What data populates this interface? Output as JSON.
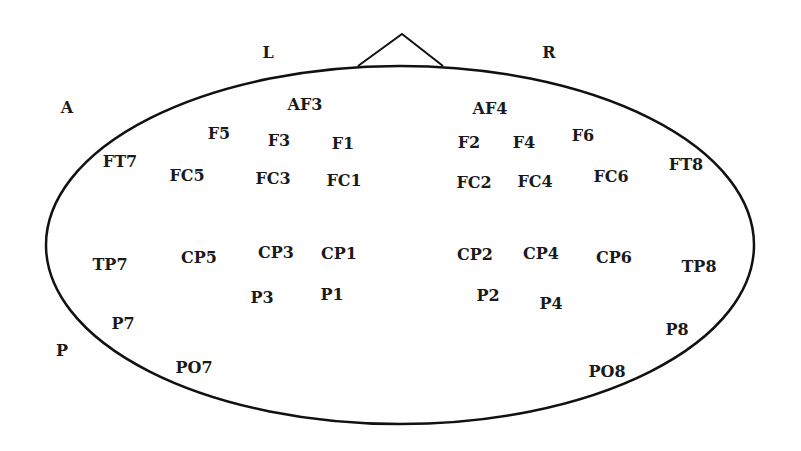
{
  "diagram": {
    "type": "eeg-electrode-map",
    "colors": {
      "stroke": "#111111",
      "text": "#1a1a1a",
      "background": "#ffffff"
    },
    "head": {
      "cx": 400,
      "cy": 245,
      "rx": 354,
      "ry": 179
    },
    "nose": {
      "points": "358,66 402,34 443,66"
    },
    "orientation_labels": [
      {
        "id": "L",
        "text": "L",
        "x": 268,
        "y": 53
      },
      {
        "id": "R",
        "text": "R",
        "x": 549,
        "y": 53
      },
      {
        "id": "A",
        "text": "A",
        "x": 67,
        "y": 108
      },
      {
        "id": "P",
        "text": "P",
        "x": 62,
        "y": 351
      }
    ],
    "electrodes": [
      {
        "id": "AF3",
        "text": "AF3",
        "x": 305,
        "y": 105
      },
      {
        "id": "AF4",
        "text": "AF4",
        "x": 490,
        "y": 109
      },
      {
        "id": "F5",
        "text": "F5",
        "x": 219,
        "y": 134
      },
      {
        "id": "F3",
        "text": "F3",
        "x": 279,
        "y": 141
      },
      {
        "id": "F1",
        "text": "F1",
        "x": 343,
        "y": 144
      },
      {
        "id": "F2",
        "text": "F2",
        "x": 469,
        "y": 143
      },
      {
        "id": "F4",
        "text": "F4",
        "x": 524,
        "y": 143
      },
      {
        "id": "F6",
        "text": "F6",
        "x": 583,
        "y": 136
      },
      {
        "id": "FT7",
        "text": "FT7",
        "x": 120,
        "y": 162
      },
      {
        "id": "FT8",
        "text": "FT8",
        "x": 686,
        "y": 165
      },
      {
        "id": "FC5",
        "text": "FC5",
        "x": 187,
        "y": 176
      },
      {
        "id": "FC3",
        "text": "FC3",
        "x": 273,
        "y": 179
      },
      {
        "id": "FC1",
        "text": "FC1",
        "x": 344,
        "y": 181
      },
      {
        "id": "FC2",
        "text": "FC2",
        "x": 474,
        "y": 183
      },
      {
        "id": "FC4",
        "text": "FC4",
        "x": 535,
        "y": 182
      },
      {
        "id": "FC6",
        "text": "FC6",
        "x": 611,
        "y": 177
      },
      {
        "id": "TP7",
        "text": "TP7",
        "x": 110,
        "y": 265
      },
      {
        "id": "CP5",
        "text": "CP5",
        "x": 199,
        "y": 258
      },
      {
        "id": "CP3",
        "text": "CP3",
        "x": 276,
        "y": 253
      },
      {
        "id": "CP1",
        "text": "CP1",
        "x": 339,
        "y": 254
      },
      {
        "id": "CP2",
        "text": "CP2",
        "x": 475,
        "y": 255
      },
      {
        "id": "CP4",
        "text": "CP4",
        "x": 541,
        "y": 254
      },
      {
        "id": "CP6",
        "text": "CP6",
        "x": 614,
        "y": 258
      },
      {
        "id": "TP8",
        "text": "TP8",
        "x": 699,
        "y": 267
      },
      {
        "id": "P3",
        "text": "P3",
        "x": 262,
        "y": 298
      },
      {
        "id": "P1",
        "text": "P1",
        "x": 332,
        "y": 295
      },
      {
        "id": "P2",
        "text": "P2",
        "x": 488,
        "y": 296
      },
      {
        "id": "P4",
        "text": "P4",
        "x": 551,
        "y": 304
      },
      {
        "id": "P7",
        "text": "P7",
        "x": 123,
        "y": 324
      },
      {
        "id": "P8",
        "text": "P8",
        "x": 677,
        "y": 330
      },
      {
        "id": "PO7",
        "text": "PO7",
        "x": 194,
        "y": 368
      },
      {
        "id": "PO8",
        "text": "PO8",
        "x": 607,
        "y": 372
      }
    ]
  }
}
